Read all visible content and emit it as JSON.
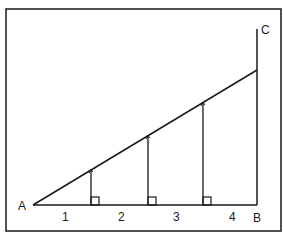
{
  "diagram": {
    "type": "right-triangle-with-perpendiculars",
    "colors": {
      "stroke": "#1a1a1a",
      "background": "#ffffff"
    },
    "points": {
      "A": {
        "label": "A",
        "x": 33,
        "y": 205
      },
      "B": {
        "label": "B",
        "x": 257,
        "y": 205
      },
      "C": {
        "label": "C",
        "x": 257,
        "y": 29
      },
      "hyp_end": {
        "x": 257,
        "y": 70
      }
    },
    "segment_labels": [
      "1",
      "2",
      "3",
      "4"
    ],
    "perpendiculars": [
      {
        "x": 91,
        "index": 1
      },
      {
        "x": 148,
        "index": 2
      },
      {
        "x": 203,
        "index": 3
      }
    ]
  }
}
